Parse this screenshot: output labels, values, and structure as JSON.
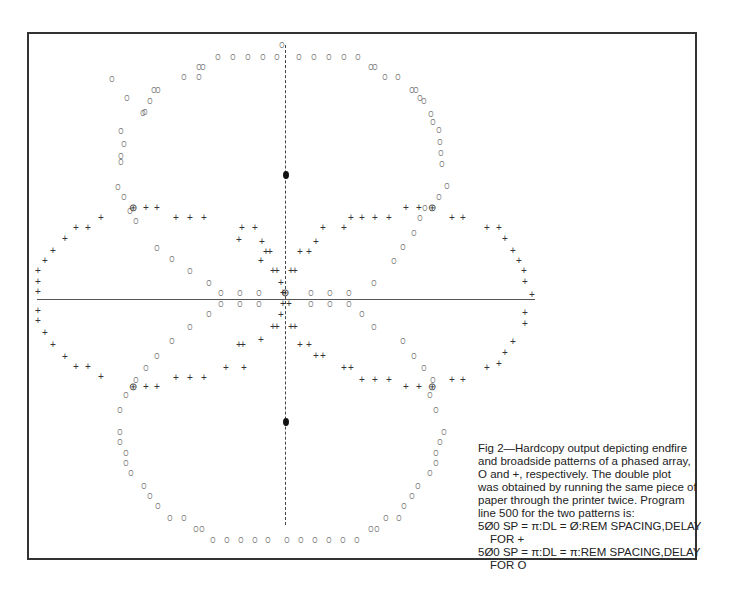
{
  "figure": {
    "label": "Fig 2",
    "caption_lines": [
      "Fig 2—Hardcopy output depicting endfire",
      "and broadside patterns of a phased array,",
      "O and  +, respectively. The double plot",
      "was obtained by running the same piece of",
      "paper through the printer twice. Program",
      "line 500 for the two patterns is:",
      "5Ø0 SP = π:DL = Ø:REM SPACING,DELAY",
      "FOR  +",
      "5Ø0 SP = π:DL = π:REM SPACING,DELAY",
      "FOR O"
    ],
    "program_lines": [
      {
        "code": "500 SP = π:DL = 0:REM SPACING,DELAY FOR +",
        "pattern": "broadside"
      },
      {
        "code": "500 SP = π:DL = π:REM SPACING,DELAY FOR O",
        "pattern": "endfire"
      }
    ]
  },
  "chart_data": {
    "type": "scatter",
    "xlabel": "",
    "ylabel": "",
    "legend": [
      {
        "symbol": "O",
        "name": "Endfire pattern (SP=π, DL=π)"
      },
      {
        "symbol": "+",
        "name": "Broadside pattern (SP=π, DL=0)"
      },
      {
        "symbol": "⊕",
        "name": "Overlap of O and +"
      }
    ],
    "axes": {
      "horizontal_axis_y": 299,
      "vertical_axis_x": 285,
      "vertical_axis_style": "dashed"
    },
    "markers": {
      "filled_dots": [
        [
          286,
          175
        ],
        [
          286,
          422
        ]
      ]
    },
    "series": [
      {
        "name": "endfire",
        "symbol": "O",
        "points": [
          [
            282,
            45
          ],
          [
            218,
            57
          ],
          [
            233,
            57
          ],
          [
            248,
            57
          ],
          [
            263,
            57
          ],
          [
            277,
            57
          ],
          [
            299,
            57
          ],
          [
            314,
            57
          ],
          [
            329,
            57
          ],
          [
            344,
            57
          ],
          [
            358,
            57
          ],
          [
            199,
            67
          ],
          [
            203,
            67
          ],
          [
            371,
            67
          ],
          [
            375,
            67
          ],
          [
            184,
            77
          ],
          [
            199,
            77
          ],
          [
            112,
            79
          ],
          [
            385,
            77
          ],
          [
            398,
            77
          ],
          [
            154,
            90
          ],
          [
            158,
            90
          ],
          [
            412,
            90
          ],
          [
            416,
            90
          ],
          [
            127,
            98
          ],
          [
            420,
            98
          ],
          [
            150,
            101
          ],
          [
            424,
            101
          ],
          [
            145,
            112
          ],
          [
            143,
            113
          ],
          [
            433,
            122
          ],
          [
            431,
            114
          ],
          [
            121,
            131
          ],
          [
            439,
            130
          ],
          [
            124,
            144
          ],
          [
            440,
            142
          ],
          [
            121,
            156
          ],
          [
            441,
            153
          ],
          [
            121,
            162
          ],
          [
            442,
            164
          ],
          [
            118,
            187
          ],
          [
            447,
            186
          ],
          [
            124,
            197
          ],
          [
            439,
            197
          ],
          [
            130,
            211
          ],
          [
            425,
            208
          ],
          [
            136,
            221
          ],
          [
            420,
            218
          ],
          [
            157,
            248
          ],
          [
            414,
            233
          ],
          [
            172,
            259
          ],
          [
            403,
            247
          ],
          [
            190,
            271
          ],
          [
            394,
            261
          ],
          [
            209,
            283
          ],
          [
            374,
            283
          ],
          [
            221,
            293
          ],
          [
            240,
            293
          ],
          [
            259,
            293
          ],
          [
            311,
            293
          ],
          [
            330,
            293
          ],
          [
            349,
            293
          ],
          [
            221,
            304
          ],
          [
            240,
            304
          ],
          [
            259,
            304
          ],
          [
            311,
            304
          ],
          [
            330,
            304
          ],
          [
            349,
            304
          ],
          [
            209,
            314
          ],
          [
            362,
            314
          ],
          [
            190,
            327
          ],
          [
            374,
            327
          ],
          [
            172,
            341
          ],
          [
            403,
            341
          ],
          [
            157,
            356
          ],
          [
            414,
            356
          ],
          [
            146,
            368
          ],
          [
            424,
            368
          ],
          [
            136,
            380
          ],
          [
            433,
            380
          ],
          [
            126,
            395
          ],
          [
            430,
            395
          ],
          [
            120,
            410
          ],
          [
            436,
            410
          ],
          [
            120,
            432
          ],
          [
            444,
            432
          ],
          [
            120,
            442
          ],
          [
            440,
            442
          ],
          [
            126,
            453
          ],
          [
            436,
            453
          ],
          [
            126,
            463
          ],
          [
            436,
            463
          ],
          [
            131,
            473
          ],
          [
            430,
            473
          ],
          [
            144,
            486
          ],
          [
            418,
            486
          ],
          [
            150,
            496
          ],
          [
            412,
            496
          ],
          [
            158,
            506
          ],
          [
            404,
            506
          ],
          [
            170,
            518
          ],
          [
            184,
            518
          ],
          [
            386,
            518
          ],
          [
            399,
            518
          ],
          [
            196,
            529
          ],
          [
            202,
            529
          ],
          [
            371,
            529
          ],
          [
            377,
            529
          ],
          [
            213,
            540
          ],
          [
            227,
            540
          ],
          [
            241,
            540
          ],
          [
            255,
            540
          ],
          [
            268,
            540
          ],
          [
            287,
            540
          ],
          [
            301,
            540
          ],
          [
            315,
            540
          ],
          [
            329,
            540
          ],
          [
            343,
            540
          ],
          [
            357,
            540
          ]
        ]
      },
      {
        "name": "broadside",
        "symbol": "+",
        "points": [
          [
            146,
            208
          ],
          [
            157,
            208
          ],
          [
            176,
            218
          ],
          [
            190,
            218
          ],
          [
            204,
            218
          ],
          [
            101,
            218
          ],
          [
            88,
            228
          ],
          [
            76,
            228
          ],
          [
            242,
            228
          ],
          [
            255,
            228
          ],
          [
            65,
            239
          ],
          [
            53,
            251
          ],
          [
            45,
            261
          ],
          [
            262,
            242
          ],
          [
            266,
            252
          ],
          [
            270,
            252
          ],
          [
            239,
            240
          ],
          [
            261,
            261
          ],
          [
            273,
            271
          ],
          [
            277,
            271
          ],
          [
            38,
            271
          ],
          [
            38,
            282
          ],
          [
            38,
            292
          ],
          [
            281,
            283
          ],
          [
            283,
            293
          ],
          [
            291,
            271
          ],
          [
            295,
            271
          ],
          [
            300,
            252
          ],
          [
            309,
            252
          ],
          [
            316,
            242
          ],
          [
            323,
            228
          ],
          [
            344,
            228
          ],
          [
            351,
            218
          ],
          [
            362,
            218
          ],
          [
            375,
            218
          ],
          [
            389,
            218
          ],
          [
            406,
            208
          ],
          [
            419,
            208
          ],
          [
            452,
            218
          ],
          [
            463,
            218
          ],
          [
            487,
            228
          ],
          [
            499,
            228
          ],
          [
            505,
            239
          ],
          [
            513,
            251
          ],
          [
            519,
            261
          ],
          [
            524,
            271
          ],
          [
            525,
            282
          ],
          [
            532,
            295
          ],
          [
            283,
            304
          ],
          [
            289,
            304
          ],
          [
            38,
            311
          ],
          [
            38,
            321
          ],
          [
            525,
            313
          ],
          [
            525,
            324
          ],
          [
            45,
            333
          ],
          [
            53,
            345
          ],
          [
            65,
            357
          ],
          [
            513,
            342
          ],
          [
            505,
            353
          ],
          [
            499,
            364
          ],
          [
            281,
            315
          ],
          [
            273,
            327
          ],
          [
            277,
            327
          ],
          [
            291,
            327
          ],
          [
            295,
            327
          ],
          [
            239,
            345
          ],
          [
            243,
            345
          ],
          [
            261,
            340
          ],
          [
            300,
            345
          ],
          [
            309,
            345
          ],
          [
            316,
            356
          ],
          [
            323,
            356
          ],
          [
            76,
            367
          ],
          [
            88,
            367
          ],
          [
            101,
            377
          ],
          [
            176,
            378
          ],
          [
            190,
            378
          ],
          [
            204,
            378
          ],
          [
            226,
            368
          ],
          [
            244,
            368
          ],
          [
            344,
            368
          ],
          [
            351,
            368
          ],
          [
            362,
            380
          ],
          [
            375,
            380
          ],
          [
            389,
            380
          ],
          [
            146,
            387
          ],
          [
            157,
            387
          ],
          [
            406,
            387
          ],
          [
            419,
            387
          ],
          [
            452,
            380
          ],
          [
            463,
            380
          ],
          [
            487,
            368
          ]
        ]
      },
      {
        "name": "overlap",
        "symbol": "⊕",
        "points": [
          [
            133,
            208
          ],
          [
            432,
            208
          ],
          [
            133,
            387
          ],
          [
            432,
            387
          ],
          [
            285,
            293
          ]
        ]
      }
    ]
  }
}
